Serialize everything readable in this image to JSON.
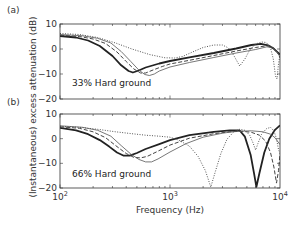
{
  "figure": {
    "xlabel": "Frequency (Hz)",
    "ylabel": "(Instantaneous) excess attenuation (dB)",
    "x_ticks": [
      {
        "value": 100,
        "base": "10",
        "exp": "2"
      },
      {
        "value": 1000,
        "base": "10",
        "exp": "3"
      },
      {
        "value": 10000,
        "base": "10",
        "exp": "4"
      }
    ]
  },
  "chart_data": [
    {
      "type": "line",
      "panel": "(a)",
      "annotation": "33% Hard ground",
      "xscale": "log",
      "xlim": [
        100,
        10000
      ],
      "ylim": [
        -20,
        10
      ],
      "yticks": [
        10,
        0,
        -10,
        -20
      ],
      "xlabel": "Frequency (Hz)",
      "ylabel": "(Instantaneous) excess attenuation (dB)",
      "grid": false,
      "legend": null,
      "series": [
        {
          "name": "thick-solid",
          "style": "solid",
          "width": 1.8,
          "color": "#222222",
          "points": [
            [
              100,
              5.2
            ],
            [
              140,
              4.6
            ],
            [
              180,
              3.4
            ],
            [
              230,
              1.2
            ],
            [
              300,
              -2.8
            ],
            [
              360,
              -6.5
            ],
            [
              420,
              -8.8
            ],
            [
              460,
              -9.4
            ],
            [
              520,
              -8.6
            ],
            [
              600,
              -7.4
            ],
            [
              800,
              -5.8
            ],
            [
              1000,
              -4.8
            ],
            [
              1500,
              -3.3
            ],
            [
              2500,
              -1.6
            ],
            [
              4000,
              0.2
            ],
            [
              5500,
              1.6
            ],
            [
              6700,
              2.1
            ],
            [
              7800,
              1.5
            ],
            [
              8800,
              0.1
            ],
            [
              10000,
              -2.2
            ]
          ]
        },
        {
          "name": "dashed",
          "style": "dashed",
          "width": 1.0,
          "color": "#444444",
          "points": [
            [
              100,
              5.5
            ],
            [
              150,
              5.0
            ],
            [
              200,
              4.0
            ],
            [
              260,
              2.2
            ],
            [
              330,
              -1.2
            ],
            [
              400,
              -5.0
            ],
            [
              470,
              -8.0
            ],
            [
              540,
              -9.6
            ],
            [
              600,
              -9.6
            ],
            [
              700,
              -8.4
            ],
            [
              850,
              -7.0
            ],
            [
              1000,
              -6.0
            ],
            [
              1500,
              -4.5
            ],
            [
              2500,
              -2.6
            ],
            [
              4000,
              -0.8
            ],
            [
              6000,
              0.6
            ],
            [
              7500,
              1.3
            ],
            [
              8500,
              1.0
            ],
            [
              9400,
              -1.0
            ],
            [
              10000,
              -3.5
            ]
          ]
        },
        {
          "name": "thin-solid",
          "style": "solid",
          "width": 0.8,
          "color": "#555555",
          "points": [
            [
              100,
              5.8
            ],
            [
              160,
              5.3
            ],
            [
              220,
              4.3
            ],
            [
              290,
              2.4
            ],
            [
              360,
              -1.0
            ],
            [
              440,
              -5.0
            ],
            [
              520,
              -8.4
            ],
            [
              590,
              -10.2
            ],
            [
              650,
              -10.6
            ],
            [
              720,
              -10.0
            ],
            [
              800,
              -8.8
            ],
            [
              1000,
              -7.2
            ],
            [
              1500,
              -5.4
            ],
            [
              2500,
              -3.4
            ],
            [
              4000,
              -1.6
            ],
            [
              6000,
              -0.2
            ],
            [
              7600,
              0.9
            ],
            [
              8600,
              0.4
            ],
            [
              9500,
              -1.4
            ],
            [
              10000,
              -3.2
            ]
          ]
        },
        {
          "name": "dotted",
          "style": "dotted",
          "width": 1.0,
          "color": "#555555",
          "points": [
            [
              100,
              6.2
            ],
            [
              150,
              5.8
            ],
            [
              220,
              4.6
            ],
            [
              320,
              2.4
            ],
            [
              450,
              0.0
            ],
            [
              650,
              -2.2
            ],
            [
              900,
              -3.5
            ],
            [
              1100,
              -3.6
            ],
            [
              1300,
              -3.0
            ],
            [
              1600,
              -1.2
            ],
            [
              2000,
              0.6
            ],
            [
              2500,
              1.6
            ],
            [
              3000,
              1.6
            ],
            [
              3400,
              0.4
            ],
            [
              3800,
              -2.6
            ],
            [
              4300,
              -6.8
            ],
            [
              4800,
              -4.0
            ],
            [
              5300,
              -0.4
            ],
            [
              6000,
              2.0
            ],
            [
              6800,
              2.8
            ],
            [
              7500,
              2.6
            ],
            [
              8200,
              0.5
            ],
            [
              8700,
              -4.0
            ],
            [
              9100,
              -10.8
            ],
            [
              9400,
              -12.0
            ],
            [
              9700,
              -6.0
            ],
            [
              10000,
              -2.2
            ]
          ]
        }
      ]
    },
    {
      "type": "line",
      "panel": "(b)",
      "annotation": "66% Hard ground",
      "xscale": "log",
      "xlim": [
        100,
        10000
      ],
      "ylim": [
        -20,
        10
      ],
      "yticks": [
        10,
        0,
        -10,
        -20
      ],
      "xlabel": "Frequency (Hz)",
      "ylabel": "(Instantaneous) excess attenuation (dB)",
      "grid": false,
      "legend": null,
      "series": [
        {
          "name": "thick-solid",
          "style": "solid",
          "width": 1.8,
          "color": "#222222",
          "points": [
            [
              100,
              4.4
            ],
            [
              140,
              3.4
            ],
            [
              180,
              1.8
            ],
            [
              230,
              -0.6
            ],
            [
              280,
              -3.2
            ],
            [
              330,
              -5.6
            ],
            [
              380,
              -6.9
            ],
            [
              430,
              -6.9
            ],
            [
              500,
              -5.8
            ],
            [
              600,
              -4.2
            ],
            [
              800,
              -2.2
            ],
            [
              1000,
              -0.6
            ],
            [
              1500,
              1.4
            ],
            [
              2500,
              2.8
            ],
            [
              3500,
              3.4
            ],
            [
              4300,
              3.3
            ],
            [
              4800,
              0.8
            ],
            [
              5400,
              -6.5
            ],
            [
              5800,
              -14.0
            ],
            [
              6100,
              -19.5
            ],
            [
              6500,
              -14.0
            ],
            [
              7200,
              -5.6
            ],
            [
              8000,
              0.0
            ],
            [
              9000,
              3.6
            ],
            [
              10000,
              5.4
            ]
          ]
        },
        {
          "name": "dashed",
          "style": "dashed",
          "width": 1.0,
          "color": "#444444",
          "points": [
            [
              100,
              4.8
            ],
            [
              150,
              4.2
            ],
            [
              200,
              2.8
            ],
            [
              260,
              0.4
            ],
            [
              330,
              -3.2
            ],
            [
              400,
              -6.0
            ],
            [
              470,
              -7.6
            ],
            [
              540,
              -7.8
            ],
            [
              620,
              -7.2
            ],
            [
              750,
              -5.4
            ],
            [
              1000,
              -2.6
            ],
            [
              1500,
              0.2
            ],
            [
              2500,
              2.0
            ],
            [
              3500,
              2.8
            ],
            [
              4500,
              3.0
            ],
            [
              5500,
              2.6
            ],
            [
              6500,
              1.4
            ],
            [
              7400,
              -1.0
            ],
            [
              8200,
              -5.6
            ],
            [
              8800,
              -11.5
            ],
            [
              9300,
              -18.0
            ],
            [
              9700,
              -13.0
            ],
            [
              10000,
              -6.0
            ]
          ]
        },
        {
          "name": "thin-solid",
          "style": "solid",
          "width": 0.8,
          "color": "#555555",
          "points": [
            [
              100,
              5.2
            ],
            [
              160,
              4.6
            ],
            [
              220,
              3.4
            ],
            [
              290,
              1.0
            ],
            [
              360,
              -2.8
            ],
            [
              440,
              -6.2
            ],
            [
              520,
              -8.4
            ],
            [
              600,
              -9.4
            ],
            [
              680,
              -9.4
            ],
            [
              780,
              -8.2
            ],
            [
              1000,
              -5.4
            ],
            [
              1400,
              -2.0
            ],
            [
              2000,
              0.6
            ],
            [
              3000,
              2.2
            ],
            [
              4000,
              3.0
            ],
            [
              5500,
              3.2
            ],
            [
              7000,
              2.8
            ],
            [
              8200,
              1.8
            ],
            [
              9000,
              0.4
            ],
            [
              10000,
              -2.4
            ]
          ]
        },
        {
          "name": "dotted",
          "style": "dotted",
          "width": 1.0,
          "color": "#555555",
          "points": [
            [
              100,
              5.0
            ],
            [
              150,
              4.6
            ],
            [
              220,
              3.8
            ],
            [
              320,
              2.8
            ],
            [
              450,
              2.0
            ],
            [
              600,
              1.4
            ],
            [
              800,
              1.0
            ],
            [
              1000,
              0.6
            ],
            [
              1200,
              -0.6
            ],
            [
              1500,
              -3.0
            ],
            [
              1800,
              -7.2
            ],
            [
              2100,
              -13.0
            ],
            [
              2350,
              -19.6
            ],
            [
              2600,
              -13.0
            ],
            [
              2900,
              -6.0
            ],
            [
              3300,
              -0.2
            ],
            [
              3800,
              2.8
            ],
            [
              4300,
              3.8
            ],
            [
              4800,
              3.4
            ],
            [
              5300,
              1.4
            ],
            [
              5700,
              -1.8
            ],
            [
              6000,
              -4.6
            ],
            [
              6300,
              -2.0
            ],
            [
              6800,
              1.8
            ],
            [
              7500,
              4.0
            ],
            [
              8200,
              4.6
            ],
            [
              8800,
              3.2
            ],
            [
              9300,
              0.0
            ],
            [
              9700,
              -4.4
            ],
            [
              10000,
              -6.0
            ]
          ]
        }
      ]
    }
  ]
}
